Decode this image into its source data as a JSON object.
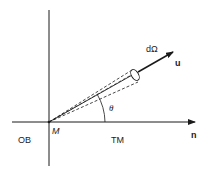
{
  "figure": {
    "labels": {
      "solid_angle": "dΩ",
      "direction_vector": "u",
      "angle": "θ",
      "point": "M",
      "normal": "n",
      "left_medium": "OB",
      "right_medium": "TM"
    },
    "angle_theta_deg": 30,
    "colors": {
      "ink": "#1a1a1a",
      "background": "#ffffff"
    }
  }
}
